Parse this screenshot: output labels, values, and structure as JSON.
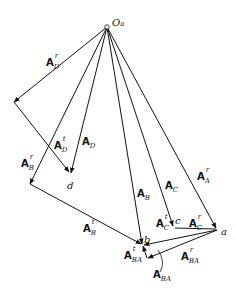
{
  "diagram": {
    "type": "acceleration polygon",
    "origin": {
      "label": "O",
      "subscript": "a"
    },
    "points": {
      "a": "a",
      "b": "b",
      "c": "c",
      "d": "d"
    },
    "vectors": [
      {
        "id": "ADr",
        "base": "A",
        "sub": "D",
        "sup": "r"
      },
      {
        "id": "ADt",
        "base": "A",
        "sub": "D",
        "sup": "t"
      },
      {
        "id": "AD",
        "base": "A",
        "sub": "D",
        "sup": ""
      },
      {
        "id": "ABr",
        "base": "A",
        "sub": "B",
        "sup": "r"
      },
      {
        "id": "ABt",
        "base": "A",
        "sub": "B",
        "sup": "t"
      },
      {
        "id": "AB",
        "base": "A",
        "sub": "B",
        "sup": ""
      },
      {
        "id": "AC",
        "base": "A",
        "sub": "C",
        "sup": ""
      },
      {
        "id": "ACt",
        "base": "A",
        "sub": "C",
        "sup": "t"
      },
      {
        "id": "ACr",
        "base": "A",
        "sub": "C",
        "sup": "r"
      },
      {
        "id": "AAr",
        "base": "A",
        "sub": "A",
        "sup": "r"
      },
      {
        "id": "ABAt",
        "base": "A",
        "sub": "BA",
        "sup": "t"
      },
      {
        "id": "ABAr",
        "base": "A",
        "sub": "BA",
        "sup": "r"
      },
      {
        "id": "ABA",
        "base": "A",
        "sub": "BA",
        "sup": ""
      }
    ]
  }
}
